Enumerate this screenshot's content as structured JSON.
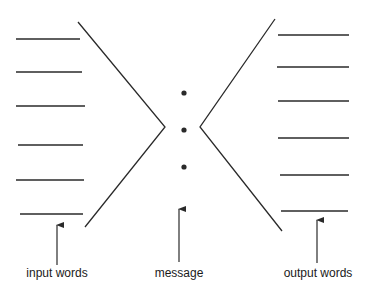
{
  "diagram": {
    "labels": {
      "input": "input words",
      "message": "message",
      "output": "output words"
    },
    "colors": {
      "stroke": "#2a2a2a",
      "background": "#ffffff"
    },
    "input_lines": [
      {
        "x1": 16,
        "x2": 80,
        "y": 39
      },
      {
        "x1": 16,
        "x2": 82,
        "y": 72
      },
      {
        "x1": 16,
        "x2": 85,
        "y": 106
      },
      {
        "x1": 18,
        "x2": 83,
        "y": 145
      },
      {
        "x1": 16,
        "x2": 84,
        "y": 180
      },
      {
        "x1": 20,
        "x2": 83,
        "y": 214
      }
    ],
    "output_lines": [
      {
        "x1": 278,
        "x2": 349,
        "y": 35
      },
      {
        "x1": 277,
        "x2": 349,
        "y": 67
      },
      {
        "x1": 278,
        "x2": 349,
        "y": 101
      },
      {
        "x1": 278,
        "x2": 349,
        "y": 138
      },
      {
        "x1": 280,
        "x2": 349,
        "y": 175
      },
      {
        "x1": 281,
        "x2": 348,
        "y": 211
      }
    ],
    "left_chevron": {
      "top": [
        78,
        22
      ],
      "vertex": [
        165,
        127
      ],
      "bottom": [
        85,
        227
      ]
    },
    "right_chevron": {
      "top": [
        275,
        19
      ],
      "vertex": [
        200,
        127
      ],
      "bottom": [
        282,
        231
      ]
    },
    "dots": [
      [
        184,
        93
      ],
      [
        184,
        130
      ],
      [
        184,
        167
      ]
    ],
    "arrows": [
      {
        "name": "input",
        "x": 57,
        "y_from": 265,
        "y_to": 225
      },
      {
        "name": "message",
        "x": 179,
        "y_from": 262,
        "y_to": 209
      },
      {
        "name": "output",
        "x": 317,
        "y_from": 263,
        "y_to": 220
      }
    ]
  }
}
